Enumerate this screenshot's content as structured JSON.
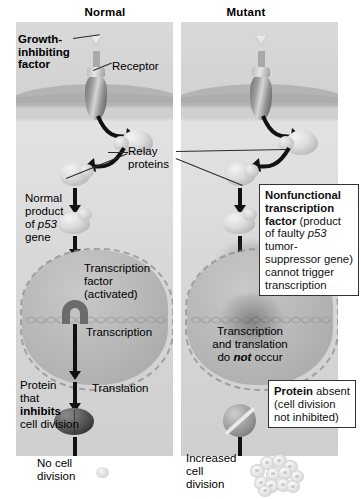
{
  "figure": {
    "headers": {
      "normal": "Normal",
      "mutant": "Mutant"
    },
    "normal_panel": {
      "growth_factor_label_line1": "Growth-",
      "growth_factor_label_line2": "inhibiting",
      "growth_factor_label_line3": "factor",
      "receptor_label": "Receptor",
      "relay_label_line1": "Relay",
      "relay_label_line2": "proteins",
      "p53_product_line1": "Normal",
      "p53_product_line2": "product",
      "p53_product_line3_prefix": "of ",
      "p53_product_line3_italic": "p53",
      "p53_product_line4": "gene",
      "transcription_factor_line1": "Transcription",
      "transcription_factor_line2": "factor",
      "transcription_factor_line3": "(activated)",
      "transcription_label": "Transcription",
      "translation_label": "Translation",
      "protein_line1": "Protein",
      "protein_line2": "that",
      "protein_line3_bold": "inhibits",
      "protein_line4": "cell division",
      "outcome_line1": "No cell",
      "outcome_line2": "division"
    },
    "mutant_panel": {
      "nonfunctional_box": {
        "bold_part": "Nonfunctional transcription factor",
        "rest_a": " (product of faulty ",
        "italic_part": "p53",
        "rest_b": " tumor-suppressor gene) cannot trigger transcription"
      },
      "no_transcription_line1": "Transcription",
      "no_transcription_line2": "and translation",
      "no_transcription_line3_pre": "do ",
      "no_transcription_line3_bolditalic": "not",
      "no_transcription_line3_post": " occur",
      "protein_absent_box": {
        "bold_part": "Protein",
        "rest": " absent (cell division not inhibited)"
      },
      "outcome_line1": "Increased",
      "outcome_line2": "cell",
      "outcome_line3": "division"
    },
    "icons": {
      "ligand": "triangle-ligand-icon",
      "receptor": "membrane-receptor-icon",
      "relay_protein": "relay-protein-blob-icon",
      "transcription_factor": "transcription-factor-icon",
      "nonfunctional_factor": "nonfunctional-transcription-factor-icon",
      "inhibitor_protein": "inhibitor-protein-icon",
      "protein_absent": "protein-absent-circle-slash-icon",
      "dna": "dna-double-helix-icon",
      "single_cell": "single-cell-icon",
      "cell_cluster": "cell-cluster-icon",
      "gray_arrow": "gray-down-arrow-icon",
      "black_arrow": "black-down-arrow-icon",
      "curved_arrow": "curved-black-arrow-icon"
    },
    "colors": {
      "panel_background": "#d8d8d8",
      "membrane": "#b4b4b4",
      "nucleus": "#b6b6b6",
      "black_arrow": "#111111",
      "gray_arrow": "#a9a9a9",
      "box_border": "#333333",
      "text": "#000000"
    }
  }
}
